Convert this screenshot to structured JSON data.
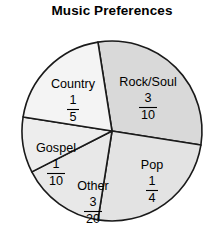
{
  "chart": {
    "title": "Music Preferences"
  },
  "chart_data": {
    "type": "pie",
    "title": "Music Preferences",
    "xlabel": "",
    "ylabel": "",
    "legend_position": "none",
    "grid": false,
    "labels_inside_slices": true,
    "value_format": "fraction",
    "categories": [
      "Rock/Soul",
      "Pop",
      "Other",
      "Gospel",
      "Country"
    ],
    "values": [
      0.3,
      0.25,
      0.15,
      0.1,
      0.2
    ],
    "value_fractions": [
      "3/10",
      "1/4",
      "3/20",
      "1/10",
      "1/5"
    ],
    "slices": [
      {
        "label": "Rock/Soul",
        "numerator": "3",
        "denominator": "10",
        "value": 0.3,
        "degrees": 108,
        "color": "#d9d9d9",
        "start_angle_deg": -9,
        "end_angle_deg": 99,
        "label_x": 148,
        "label_y": 83
      },
      {
        "label": "Pop",
        "numerator": "1",
        "denominator": "4",
        "value": 0.25,
        "degrees": 90,
        "color": "#e3e3e3",
        "start_angle_deg": 99,
        "end_angle_deg": 189,
        "label_x": 152,
        "label_y": 166
      },
      {
        "label": "Other",
        "numerator": "3",
        "denominator": "20",
        "value": 0.15,
        "degrees": 54,
        "color": "#e8e8e8",
        "start_angle_deg": 189,
        "end_angle_deg": 243,
        "label_x": 93,
        "label_y": 187
      },
      {
        "label": "Gospel",
        "numerator": "1",
        "denominator": "10",
        "value": 0.1,
        "degrees": 36,
        "color": "#ededed",
        "start_angle_deg": 243,
        "end_angle_deg": 279,
        "label_x": 56,
        "label_y": 149
      },
      {
        "label": "Country",
        "numerator": "1",
        "denominator": "5",
        "value": 0.2,
        "degrees": 72,
        "color": "#f4f4f4",
        "start_angle_deg": 279,
        "end_angle_deg": 351,
        "label_x": 73,
        "label_y": 85
      }
    ],
    "geometry": {
      "center_x": 112,
      "center_y": 131,
      "radius": 90
    }
  }
}
